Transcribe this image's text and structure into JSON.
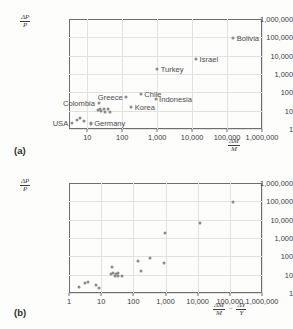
{
  "figure": {
    "panels": [
      {
        "tag": "(a)",
        "y_axis_label": {
          "numerator": "ΔP",
          "denominator": "P"
        },
        "x_axis_label_parts": [
          {
            "numerator": "ΔM",
            "denominator": "M"
          }
        ],
        "x_axis_operator": "",
        "y_ticks": [
          "1,000,000",
          "100,000",
          "10,000",
          "1,000",
          "100",
          "10",
          "1"
        ],
        "x_ticks": [
          "10",
          "100",
          "1,000",
          "10,000",
          "100,000",
          "1,000,000"
        ]
      },
      {
        "tag": "(b)",
        "y_axis_label": {
          "numerator": "ΔP",
          "denominator": "P"
        },
        "x_axis_label_parts": [
          {
            "numerator": "ΔM",
            "denominator": "M"
          },
          {
            "numerator": "ΔY",
            "denominator": "Y"
          }
        ],
        "x_axis_operator": "−",
        "y_ticks": [
          "1,000,000",
          "100,000",
          "10,000",
          "1,000",
          "100",
          "10",
          "1"
        ],
        "x_ticks": [
          "1",
          "10",
          "100",
          "1,000",
          "10,000",
          "100,000",
          "1,000,000"
        ]
      }
    ],
    "colors": {
      "point": "#8a8a8a",
      "axis": "#6e6e6e",
      "grid": "#e2e2e2",
      "text": "#3b3b3b",
      "background": "#fdfdfc"
    }
  },
  "chart_data": [
    {
      "type": "scatter",
      "panel": "(a)",
      "title": "",
      "xlabel": "ΔM/M",
      "ylabel": "ΔP/P",
      "xscale": "log",
      "yscale": "log",
      "xlim": [
        3,
        1000000
      ],
      "ylim": [
        1,
        1000000
      ],
      "grid": true,
      "legend": "none",
      "points": [
        {
          "label": "Bolivia",
          "x": 150000,
          "y": 95000,
          "label_side": "right"
        },
        {
          "label": "Israel",
          "x": 13000,
          "y": 6500,
          "label_side": "right"
        },
        {
          "label": "Turkey",
          "x": 1000,
          "y": 1900,
          "label_side": "right"
        },
        {
          "label": "Chile",
          "x": 340,
          "y": 78,
          "label_side": "right"
        },
        {
          "label": "Indonesia",
          "x": 900,
          "y": 42,
          "label_side": "right"
        },
        {
          "label": "Korea",
          "x": 180,
          "y": 15,
          "label_side": "right"
        },
        {
          "label": "Greece",
          "x": 130,
          "y": 54,
          "label_side": "left"
        },
        {
          "label": "Colombia",
          "x": 21,
          "y": 25,
          "label_side": "left"
        },
        {
          "label": "USA",
          "x": 3.6,
          "y": 2.0,
          "label_side": "left"
        },
        {
          "label": "Germany",
          "x": 12.5,
          "y": 2.1,
          "label_side": "right"
        },
        {
          "label": "",
          "x": 20,
          "y": 11
        },
        {
          "label": "",
          "x": 23,
          "y": 12
        },
        {
          "label": "",
          "x": 25,
          "y": 9.5
        },
        {
          "label": "",
          "x": 30,
          "y": 12
        },
        {
          "label": "",
          "x": 33,
          "y": 9.0
        },
        {
          "label": "",
          "x": 40,
          "y": 12
        },
        {
          "label": "",
          "x": 44,
          "y": 9.0
        },
        {
          "label": "",
          "x": 5.2,
          "y": 3.2
        },
        {
          "label": "",
          "x": 6.4,
          "y": 3.8
        },
        {
          "label": "",
          "x": 8.0,
          "y": 2.8
        },
        {
          "label": "",
          "x": 12.5,
          "y": 1.8
        }
      ]
    },
    {
      "type": "scatter",
      "panel": "(b)",
      "title": "",
      "xlabel": "ΔM/M − ΔY/Y",
      "ylabel": "ΔP/P",
      "xscale": "log",
      "yscale": "log",
      "xlim": [
        1,
        1000000
      ],
      "ylim": [
        1,
        1000000
      ],
      "grid": true,
      "legend": "none",
      "points": [
        {
          "x": 130000,
          "y": 95000
        },
        {
          "x": 12000,
          "y": 6500
        },
        {
          "x": 950,
          "y": 1900
        },
        {
          "x": 330,
          "y": 78
        },
        {
          "x": 140,
          "y": 55
        },
        {
          "x": 900,
          "y": 42
        },
        {
          "x": 21,
          "y": 26
        },
        {
          "x": 170,
          "y": 15
        },
        {
          "x": 20,
          "y": 11
        },
        {
          "x": 24,
          "y": 12
        },
        {
          "x": 28,
          "y": 11
        },
        {
          "x": 33,
          "y": 12
        },
        {
          "x": 26,
          "y": 8.5
        },
        {
          "x": 34,
          "y": 8.5
        },
        {
          "x": 44,
          "y": 8.5
        },
        {
          "x": 2.1,
          "y": 2.0
        },
        {
          "x": 3.2,
          "y": 3.4
        },
        {
          "x": 3.8,
          "y": 3.8
        },
        {
          "x": 7.0,
          "y": 2.8
        },
        {
          "x": 8.5,
          "y": 1.9
        }
      ]
    }
  ]
}
